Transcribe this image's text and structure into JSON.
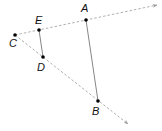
{
  "diagram": {
    "points": [
      {
        "id": "A",
        "label": "A",
        "x": 86,
        "y": 20,
        "lx": 81,
        "ly": 12
      },
      {
        "id": "B",
        "label": "B",
        "x": 98,
        "y": 101,
        "lx": 92,
        "ly": 115
      },
      {
        "id": "C",
        "label": "C",
        "x": 15,
        "y": 35,
        "lx": 9,
        "ly": 47
      },
      {
        "id": "D",
        "label": "D",
        "x": 43,
        "y": 57,
        "lx": 37,
        "ly": 71
      },
      {
        "id": "E",
        "label": "E",
        "x": 39,
        "y": 30,
        "lx": 35,
        "ly": 24
      }
    ],
    "rays": [
      {
        "from": "C",
        "through": [
          "E",
          "A"
        ],
        "x1": 15,
        "y1": 35,
        "x2": 157,
        "y2": 5
      },
      {
        "from": "C",
        "through": [
          "D",
          "B"
        ],
        "x1": 15,
        "y1": 35,
        "x2": 128,
        "y2": 124
      }
    ],
    "segments": [
      {
        "from": "E",
        "to": "D"
      },
      {
        "from": "A",
        "to": "B"
      }
    ],
    "colors": {
      "ray": "#9a9a9a",
      "segment": "#777777",
      "point": "#000000"
    }
  }
}
